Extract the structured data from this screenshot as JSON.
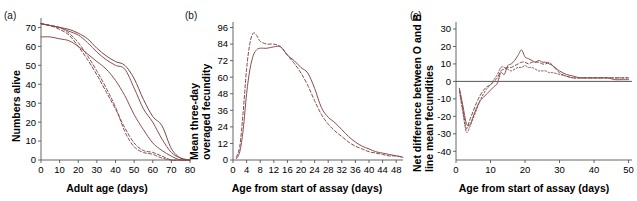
{
  "figure": {
    "background": "#ffffff",
    "line_color": "#8a4f4f",
    "line_color_alt": "#7d4747",
    "axis_color": "#555555"
  },
  "panels": [
    {
      "id": "a",
      "label": "(a)",
      "xlabel": "Adult age (days)",
      "ylabel": "Numbers alive",
      "ylabel_lines": [
        "Numbers alive"
      ],
      "xticks": [
        0,
        10,
        20,
        30,
        40,
        50,
        60,
        70,
        80
      ],
      "yticks": [
        0,
        10,
        20,
        30,
        40,
        50,
        60,
        70
      ],
      "xlim": [
        0,
        80
      ],
      "ylim": [
        0,
        75
      ]
    },
    {
      "id": "b",
      "label": "(b)",
      "xlabel": "Age from start of assay (days)",
      "ylabel": "Mean three-day overaged fecundity",
      "ylabel_lines": [
        "Mean three-day",
        "overaged fecundity"
      ],
      "xticks": [
        0,
        4,
        8,
        12,
        16,
        20,
        24,
        28,
        32,
        36,
        40,
        44,
        48
      ],
      "yticks": [
        0,
        12,
        24,
        36,
        48,
        60,
        72,
        84,
        96
      ],
      "xlim": [
        0,
        50
      ],
      "ylim": [
        0,
        100
      ]
    },
    {
      "id": "c",
      "label": "(c)",
      "xlabel": "Age from start of assay (days)",
      "ylabel": "Net difference between O and B line mean fecundities",
      "ylabel_lines": [
        "Net difference between O and B",
        "line mean fecundities"
      ],
      "xticks": [
        0,
        10,
        20,
        30,
        40,
        50
      ],
      "yticks": [
        -40,
        -30,
        -20,
        -10,
        0,
        10,
        20,
        30
      ],
      "xlim": [
        0,
        51
      ],
      "ylim": [
        -45,
        34
      ]
    }
  ],
  "chart_data": [
    {
      "type": "line",
      "panel": "a",
      "title": "(a)",
      "xlabel": "Adult age (days)",
      "ylabel": "Numbers alive",
      "xlim": [
        0,
        80
      ],
      "ylim": [
        0,
        75
      ],
      "grid": false,
      "legend": "none",
      "x": [
        0,
        5,
        10,
        15,
        20,
        25,
        30,
        35,
        40,
        45,
        50,
        55,
        60,
        65,
        70,
        75,
        80
      ],
      "series": [
        {
          "name": "O line replicate 1",
          "style": "solid",
          "values": [
            72,
            71,
            70,
            68,
            66,
            62,
            57,
            53,
            50,
            48,
            38,
            27,
            20,
            11,
            4,
            1,
            0
          ]
        },
        {
          "name": "O line replicate 2",
          "style": "solid",
          "values": [
            72,
            71,
            70,
            69,
            67,
            64,
            59,
            55,
            52,
            50,
            43,
            32,
            23,
            18,
            6,
            1,
            0
          ]
        },
        {
          "name": "B line replicate 1",
          "style": "solid",
          "values": [
            65,
            65,
            64,
            63,
            60,
            56,
            52,
            48,
            42,
            34,
            24,
            16,
            9,
            5,
            2,
            0,
            0
          ]
        },
        {
          "name": "B line replicate 2",
          "style": "dashed",
          "values": [
            72,
            71,
            69,
            66,
            60,
            53,
            45,
            36,
            27,
            17,
            9,
            5,
            4,
            2,
            0,
            0,
            0
          ]
        },
        {
          "name": "B line replicate 3",
          "style": "dashed",
          "values": [
            72,
            71,
            70,
            67,
            62,
            55,
            47,
            38,
            28,
            15,
            7,
            4,
            3,
            1,
            0,
            0,
            0
          ]
        }
      ]
    },
    {
      "type": "line",
      "panel": "b",
      "title": "(b)",
      "xlabel": "Age from start of assay (days)",
      "ylabel": "Mean three-day overaged fecundity",
      "xlim": [
        0,
        50
      ],
      "ylim": [
        0,
        100
      ],
      "grid": false,
      "legend": "none",
      "x": [
        1,
        2,
        3,
        4,
        5,
        6,
        7,
        8,
        10,
        12,
        14,
        16,
        18,
        20,
        22,
        24,
        26,
        28,
        30,
        32,
        34,
        36,
        38,
        40,
        42,
        44,
        46,
        48,
        50
      ],
      "series": [
        {
          "name": "O line mean fecundity",
          "style": "solid",
          "values": [
            1,
            6,
            22,
            48,
            66,
            76,
            80,
            81,
            81,
            82,
            82,
            76,
            72,
            67,
            63,
            52,
            38,
            31,
            27,
            22,
            17,
            13,
            10,
            8,
            6,
            5,
            4,
            3,
            2
          ]
        },
        {
          "name": "B line mean fecundity",
          "style": "dashed",
          "values": [
            2,
            10,
            35,
            66,
            85,
            92,
            90,
            86,
            84,
            84,
            82,
            76,
            70,
            63,
            54,
            43,
            33,
            26,
            21,
            17,
            13,
            10,
            8,
            6,
            5,
            4,
            3,
            3,
            2
          ]
        }
      ]
    },
    {
      "type": "line",
      "panel": "c",
      "title": "(c)",
      "xlabel": "Age from start of assay (days)",
      "ylabel": "Net difference between O and B line mean fecundities",
      "xlim": [
        0,
        51
      ],
      "ylim": [
        -45,
        34
      ],
      "grid": false,
      "legend": "none",
      "zero_reference_line": 0,
      "x": [
        1,
        2,
        3,
        4,
        5,
        6,
        7,
        8,
        9,
        10,
        11,
        12,
        13,
        14,
        15,
        16,
        17,
        18,
        19,
        20,
        21,
        22,
        23,
        24,
        25,
        26,
        27,
        28,
        30,
        32,
        34,
        36,
        38,
        40,
        42,
        44,
        46,
        48,
        50
      ],
      "series": [
        {
          "name": "Replicate 1",
          "style": "solid",
          "values": [
            -4,
            -14,
            -24,
            -25,
            -20,
            -15,
            -11,
            -9,
            -7,
            -5,
            -3,
            -1,
            5,
            4,
            9,
            10,
            12,
            15,
            18,
            14,
            13,
            12,
            11,
            12,
            11,
            11,
            10,
            9,
            6,
            4,
            3,
            2,
            2,
            2,
            2,
            2,
            1,
            1,
            1
          ]
        },
        {
          "name": "Replicate 2",
          "style": "dashed",
          "values": [
            -5,
            -16,
            -27,
            -22,
            -17,
            -12,
            -8,
            -5,
            -3,
            -2,
            0,
            2,
            6,
            7,
            8,
            8,
            9,
            10,
            11,
            11,
            10,
            11,
            11,
            11,
            10,
            10,
            11,
            9,
            5,
            3,
            2,
            2,
            2,
            2,
            2,
            2,
            2,
            2,
            2
          ]
        },
        {
          "name": "Replicate 3",
          "style": "dotted",
          "values": [
            -6,
            -18,
            -29,
            -26,
            -21,
            -16,
            -11,
            -7,
            -4,
            -2,
            1,
            4,
            8,
            8,
            7,
            6,
            7,
            8,
            8,
            9,
            8,
            8,
            7,
            6,
            6,
            6,
            5,
            5,
            4,
            3,
            2,
            2,
            2,
            2,
            2,
            2,
            2,
            2,
            2
          ]
        }
      ]
    }
  ]
}
